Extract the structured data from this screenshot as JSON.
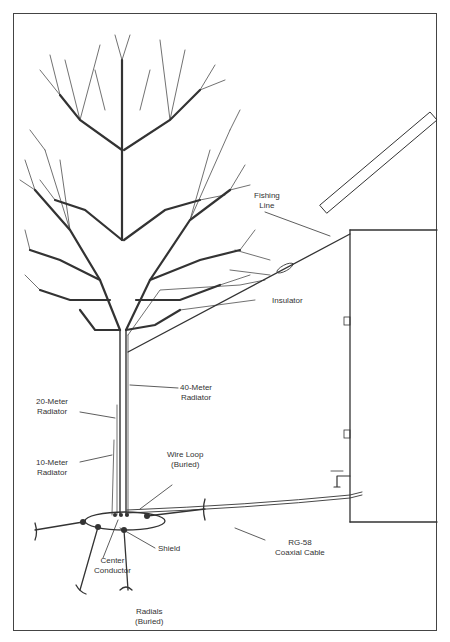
{
  "diagram": {
    "labels": {
      "fishing_line": [
        "Fishing",
        "Line"
      ],
      "insulator": [
        "Insulator"
      ],
      "radiator_40m": [
        "40-Meter",
        "Radiator"
      ],
      "radiator_20m": [
        "20-Meter",
        "Radiator"
      ],
      "radiator_10m": [
        "10-Meter",
        "Radiator"
      ],
      "wire_loop": [
        "Wire Loop",
        "(Buried)"
      ],
      "shield": [
        "Shield"
      ],
      "center_conductor": [
        "Center",
        "Conductor"
      ],
      "coax": [
        "RG-58",
        "Coaxial Cable"
      ],
      "radials": [
        "Radials",
        "(Buried)"
      ]
    },
    "colors": {
      "line": "#333333",
      "border": "#444444",
      "background": "#ffffff"
    }
  }
}
